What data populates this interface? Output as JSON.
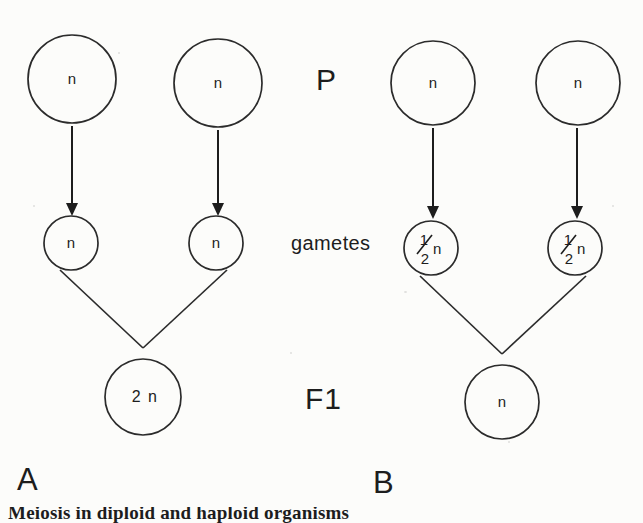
{
  "figure": {
    "background_color": "#fcfcfa",
    "ink_color": "#1d1d1d",
    "stage_labels": {
      "parent": "P",
      "gametes": "gametes",
      "offspring": "F1"
    },
    "panels": [
      {
        "id": "A",
        "label": "A",
        "parents": [
          {
            "id": "a-parent-left",
            "label": "n",
            "cx": 72,
            "cy": 79,
            "r": 44
          },
          {
            "id": "a-parent-right",
            "label": "n",
            "cx": 218,
            "cy": 83,
            "r": 44
          }
        ],
        "gametes": [
          {
            "id": "a-gamete-left",
            "label": "n",
            "cx": 71,
            "cy": 243,
            "r": 27
          },
          {
            "id": "a-gamete-right",
            "label": "n",
            "cx": 216,
            "cy": 243,
            "r": 27
          }
        ],
        "offspring": {
          "id": "a-offspring",
          "label": "2 n",
          "cx": 143,
          "cy": 397,
          "r": 38
        },
        "arrows": [
          {
            "id": "a-arrow-left",
            "x": 72,
            "y1": 126,
            "y2": 213
          },
          {
            "id": "a-arrow-right",
            "x": 218,
            "y1": 130,
            "y2": 213
          }
        ]
      },
      {
        "id": "B",
        "label": "B",
        "parents": [
          {
            "id": "b-parent-left",
            "label": "n",
            "cx": 433,
            "cy": 83,
            "r": 42
          },
          {
            "id": "b-parent-right",
            "label": "n",
            "cx": 578,
            "cy": 83,
            "r": 42
          }
        ],
        "gametes": [
          {
            "id": "b-gamete-left",
            "numerator": "1",
            "denominator": "2",
            "suffix": "n",
            "cx": 431,
            "cy": 248,
            "r": 27
          },
          {
            "id": "b-gamete-right",
            "numerator": "1",
            "denominator": "2",
            "suffix": "n",
            "cx": 575,
            "cy": 248,
            "r": 27
          }
        ],
        "offspring": {
          "id": "b-offspring",
          "label": "n",
          "cx": 502,
          "cy": 402,
          "r": 37
        },
        "arrows": [
          {
            "id": "b-arrow-left",
            "x": 433,
            "y1": 128,
            "y2": 217
          },
          {
            "id": "b-arrow-right",
            "x": 577,
            "y1": 128,
            "y2": 217
          }
        ]
      }
    ],
    "caption": "Meiosis in diploid and haploid organisms"
  }
}
